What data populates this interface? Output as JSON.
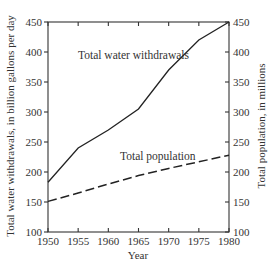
{
  "chart_data": {
    "type": "line",
    "title": "",
    "xlabel": "Year",
    "ylabel": "Total water withdrawals, in billion gallons per day",
    "y2label": "Total population, in millions",
    "x": [
      1950,
      1955,
      1960,
      1965,
      1970,
      1975,
      1980
    ],
    "xlim": [
      1950,
      1980
    ],
    "ylim": [
      100,
      450
    ],
    "y2lim": [
      100,
      450
    ],
    "xticks": [
      "1950",
      "1955",
      "1960",
      "1965",
      "1970",
      "1975",
      "1980"
    ],
    "yticks": [
      "100",
      "150",
      "200",
      "250",
      "300",
      "350",
      "400",
      "450"
    ],
    "y2ticks": [
      "100",
      "150",
      "200",
      "250",
      "300",
      "350",
      "400",
      "450"
    ],
    "grid": false,
    "legend": "none",
    "series": [
      {
        "name": "Total water withdrawals",
        "axis": "left",
        "style": "solid",
        "values": [
          183,
          240,
          270,
          305,
          370,
          420,
          450
        ]
      },
      {
        "name": "Total population",
        "axis": "right",
        "style": "dashed",
        "values": [
          151,
          165,
          180,
          194,
          206,
          217,
          228
        ]
      }
    ],
    "annotations": [
      {
        "text": "Total water withdrawals",
        "series": 0
      },
      {
        "text": "Total population",
        "series": 1
      }
    ]
  }
}
